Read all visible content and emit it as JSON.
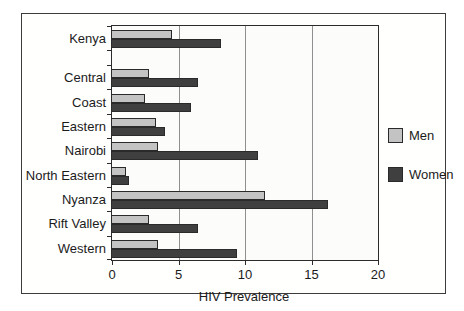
{
  "figure": {
    "background": "#ffffff",
    "frame_border": "#3c3c3c",
    "plot_background": "#fcfcfa"
  },
  "chart_data": {
    "type": "bar",
    "orientation": "horizontal",
    "title": "",
    "xlabel": "HIV Prevalence",
    "ylabel": "",
    "xlim": [
      0,
      20
    ],
    "xticks": [
      0,
      5,
      10,
      15,
      20
    ],
    "grid": "vertical gridlines at 5, 10 and 15",
    "legend_position": "right of plot",
    "gap_after_first_category": true,
    "categories": [
      "Kenya",
      "Central",
      "Coast",
      "Eastern",
      "Nairobi",
      "North Eastern",
      "Nyanza",
      "Rift Valley",
      "Western"
    ],
    "series": [
      {
        "name": "Men",
        "color": "#c3c3c3",
        "values": [
          4.4,
          2.7,
          2.4,
          3.2,
          3.4,
          1.0,
          11.4,
          2.7,
          3.4
        ]
      },
      {
        "name": "Women",
        "color": "#3f3f3f",
        "values": [
          8.1,
          6.4,
          5.9,
          3.9,
          10.9,
          1.2,
          16.2,
          6.4,
          9.3
        ]
      }
    ]
  }
}
